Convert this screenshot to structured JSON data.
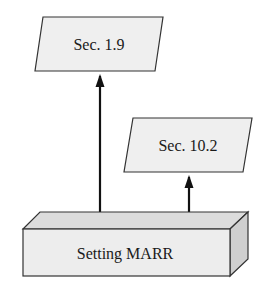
{
  "diagram": {
    "nodes": [
      {
        "id": "sec19",
        "label": "Sec. 1.9",
        "shape": "parallelogram"
      },
      {
        "id": "sec102",
        "label": "Sec. 10.2",
        "shape": "parallelogram"
      },
      {
        "id": "marr",
        "label": "Setting MARR",
        "shape": "3d-box"
      }
    ],
    "edges": [
      {
        "from": "marr",
        "to": "sec19"
      },
      {
        "from": "marr",
        "to": "sec102"
      }
    ],
    "colors": {
      "fill": "#eeeeee",
      "top_face": "#dcdcdc",
      "side_face": "#d0d0d0",
      "stroke": "#222222"
    }
  }
}
